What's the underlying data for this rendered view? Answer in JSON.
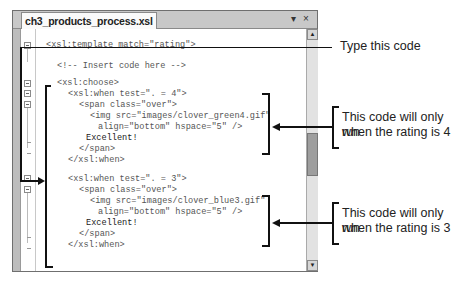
{
  "window": {
    "tab_title": "ch3_products_process.xsl",
    "dropdown_glyph": "▾",
    "close_glyph": "×"
  },
  "scrollbar": {
    "up_glyph": "▲",
    "down_glyph": "▼"
  },
  "code_lines": [
    "<xsl:template match=\"rating\">",
    "<!-- Insert code here -->",
    "<xsl:choose>",
    "<xsl:when test=\". = 4\">",
    "<span class=\"over\">",
    "<img src=\"images/clover_green4.gif\"",
    "align=\"bottom\" hspace=\"5\" />",
    "Excellent!",
    "</span>",
    "</xsl:when>",
    "<xsl:when test=\". = 3\">",
    "<span class=\"over\">",
    "<img src=\"images/clover_blue3.gif\"",
    "align=\"bottom\" hspace=\"5\" />",
    "Excellent!",
    "</span>",
    "</xsl:when>"
  ],
  "callouts": {
    "type_this_code": "Type this code",
    "rating4_line1": "This code will only run",
    "rating4_line2": "when the rating is 4",
    "rating3_line1": "This code will only run",
    "rating3_line2": "when the rating is 3"
  },
  "colors": {
    "annotation_line": "#111111",
    "code_text": "#555555",
    "window_frame": "#bdbdbd"
  }
}
